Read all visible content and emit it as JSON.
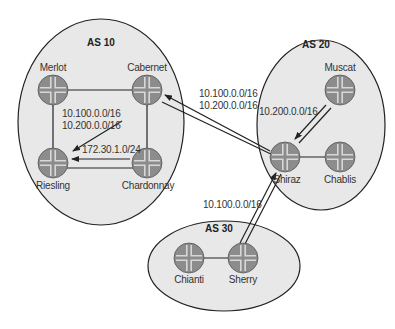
{
  "diagram": {
    "colors": {
      "as_fill": "#e8e8e8",
      "as_stroke": "#222222",
      "router_fill": "#8c8c8c",
      "router_cross": "#d8d8d8",
      "line": "#222222"
    },
    "autonomous_systems": [
      {
        "id": "as10",
        "label": "AS 10",
        "cx": 101,
        "cy": 122,
        "rx": 83,
        "ry": 103,
        "label_x": 101,
        "label_y": 42
      },
      {
        "id": "as20",
        "label": "AS 20",
        "cx": 321,
        "cy": 125,
        "rx": 64,
        "ry": 85,
        "label_x": 316,
        "label_y": 44
      },
      {
        "id": "as30",
        "label": "AS 30",
        "cx": 224,
        "cy": 266,
        "rx": 76,
        "ry": 45,
        "label_x": 219,
        "label_y": 228
      }
    ],
    "routers": [
      {
        "id": "merlot",
        "label": "Merlot",
        "x": 53,
        "y": 90,
        "label_pos": "above"
      },
      {
        "id": "cabernet",
        "label": "Cabernet",
        "x": 147,
        "y": 90,
        "label_pos": "above"
      },
      {
        "id": "riesling",
        "label": "Riesling",
        "x": 53,
        "y": 163,
        "label_pos": "below"
      },
      {
        "id": "chardonnay",
        "label": "Chardonnay",
        "x": 147,
        "y": 163,
        "label_pos": "below"
      },
      {
        "id": "muscat",
        "label": "Muscat",
        "x": 340,
        "y": 90,
        "label_pos": "above"
      },
      {
        "id": "shiraz",
        "label": "Shiraz",
        "x": 285,
        "y": 157,
        "label_pos": "below"
      },
      {
        "id": "chablis",
        "label": "Chablis",
        "x": 340,
        "y": 157,
        "label_pos": "below"
      },
      {
        "id": "chianti",
        "label": "Chianti",
        "x": 189,
        "y": 258,
        "label_pos": "below"
      },
      {
        "id": "sherry",
        "label": "Sherry",
        "x": 243,
        "y": 258,
        "label_pos": "below"
      }
    ],
    "links": [
      [
        "merlot",
        "cabernet"
      ],
      [
        "merlot",
        "riesling"
      ],
      [
        "cabernet",
        "chardonnay"
      ],
      [
        "riesling",
        "chardonnay"
      ],
      [
        "shiraz",
        "chablis"
      ],
      [
        "chianti",
        "sherry"
      ]
    ],
    "route_annotations": [
      {
        "id": "cab-to-riesling",
        "lines": [
          "10.100.0.0/16",
          "10.200.0.0/16"
        ],
        "x": 62,
        "y": 112
      },
      {
        "id": "chard-to-riesling",
        "lines": [
          "172.30.1.0/24"
        ],
        "x": 82,
        "y": 145
      },
      {
        "id": "shiraz-to-cabernet",
        "lines": [
          "10.100.0.0/16",
          "10.200.0.0/16"
        ],
        "x": 199,
        "y": 88
      },
      {
        "id": "muscat-to-shiraz",
        "lines": [
          "10.200.0.0/16"
        ],
        "x": 260,
        "y": 108
      },
      {
        "id": "sherry-to-shiraz",
        "lines": [
          "10.100.0.0/16"
        ],
        "x": 202,
        "y": 201
      }
    ]
  }
}
